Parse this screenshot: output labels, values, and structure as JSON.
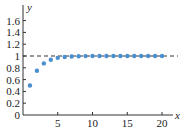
{
  "chart_data": {
    "type": "scatter",
    "title": "",
    "xlabel": "x",
    "ylabel": "y",
    "xlim": [
      0,
      21.5
    ],
    "ylim": [
      0,
      1.7
    ],
    "x_ticks": [
      5,
      10,
      15,
      20
    ],
    "x_tick_labels": [
      "5",
      "10",
      "15",
      "20"
    ],
    "y_ticks": [
      0,
      0.2,
      0.4,
      0.6,
      0.8,
      1,
      1.2,
      1.4,
      1.6
    ],
    "y_tick_labels": [
      "0",
      "0.2",
      "0.4",
      "0.6",
      "0.8",
      "1",
      "1.2",
      "1.4",
      "1.6"
    ],
    "grid": false,
    "legend": null,
    "series": [
      {
        "name": "sequence",
        "x": [
          1,
          2,
          3,
          4,
          5,
          6,
          7,
          8,
          9,
          10,
          11,
          12,
          13,
          14,
          15,
          16,
          17,
          18,
          19,
          20
        ],
        "values": [
          0.5,
          0.75,
          0.875,
          0.9375,
          0.96875,
          0.984,
          0.992,
          0.996,
          0.998,
          0.999,
          1.0,
          1.0,
          1.0,
          1.0,
          1.0,
          1.0,
          1.0,
          1.0,
          1.0,
          1.0
        ],
        "color": "#4a8fce"
      }
    ],
    "annotations": [
      {
        "type": "horizontal-dashed-line",
        "y": 1,
        "color": "#333333"
      }
    ]
  },
  "colors": {
    "points": "#4a8fce",
    "axis": "#333333",
    "dashed_line": "#333333"
  }
}
